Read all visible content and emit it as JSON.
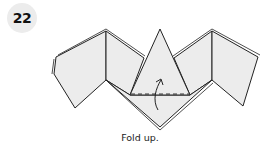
{
  "step": {
    "number": "22"
  },
  "diagram": {
    "fold_line": "dashed valley fold",
    "arrow": "fold-up arrow",
    "colors": {
      "paper": "#ececec",
      "line": "#222222"
    }
  },
  "caption": {
    "text": "Fold up."
  }
}
